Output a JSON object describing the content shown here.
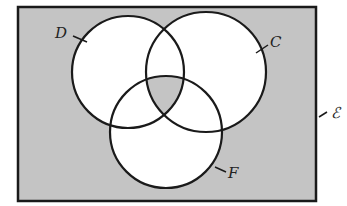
{
  "diagram": {
    "type": "venn",
    "universal_set_label": "ℰ",
    "sets": [
      {
        "label": "D",
        "cx": 128,
        "cy": 72,
        "r": 56
      },
      {
        "label": "C",
        "cx": 206,
        "cy": 72,
        "r": 60
      },
      {
        "label": "F",
        "cx": 166,
        "cy": 132,
        "r": 56
      }
    ],
    "shaded_regions": [
      "outside all sets",
      "D ∩ C ∩ F"
    ],
    "colors": {
      "shade": "#c4c4c4",
      "unshaded": "#ffffff",
      "stroke": "#1a1a1a"
    }
  }
}
